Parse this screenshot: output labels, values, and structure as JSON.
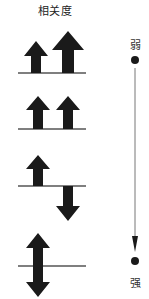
{
  "title": "相关度",
  "scale": {
    "top_label": "弱",
    "bottom_label": "强"
  },
  "panels": [
    {
      "id": 1,
      "description": "two up arrows of unequal size"
    },
    {
      "id": 2,
      "description": "two equal up arrows"
    },
    {
      "id": 3,
      "description": "one up arrow and one down arrow"
    },
    {
      "id": 4,
      "description": "double-headed vertical arrow"
    }
  ],
  "colors": {
    "arrow": "#1a1a1a",
    "line": "#555555"
  }
}
